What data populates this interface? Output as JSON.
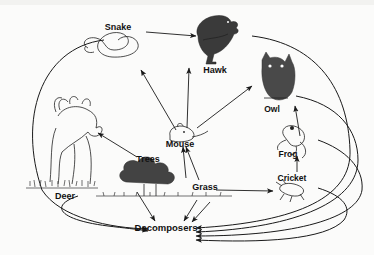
{
  "diagram": {
    "background_color": "#fbfbfa",
    "line_color": "#1a1a1a",
    "nodes": [
      {
        "id": "snake",
        "label": "Snake",
        "x": 118,
        "y": 30,
        "type": "consumer"
      },
      {
        "id": "hawk",
        "label": "Hawk",
        "x": 215,
        "y": 70,
        "type": "consumer"
      },
      {
        "id": "owl",
        "label": "Owl",
        "x": 272,
        "y": 110,
        "type": "consumer"
      },
      {
        "id": "mouse",
        "label": "Mouse",
        "x": 180,
        "y": 142,
        "type": "consumer"
      },
      {
        "id": "deer",
        "label": "Deer",
        "x": 65,
        "y": 185,
        "type": "consumer"
      },
      {
        "id": "trees",
        "label": "Trees",
        "x": 148,
        "y": 158,
        "type": "producer"
      },
      {
        "id": "grass",
        "label": "Grass",
        "x": 205,
        "y": 185,
        "type": "producer"
      },
      {
        "id": "frog",
        "label": "Frog",
        "x": 291,
        "y": 153,
        "type": "consumer"
      },
      {
        "id": "cricket",
        "label": "Cricket",
        "x": 292,
        "y": 178,
        "type": "consumer"
      },
      {
        "id": "decomposers",
        "label": "Decomposers",
        "x": 166,
        "y": 228,
        "type": "decomposer"
      }
    ],
    "edges": [
      {
        "from": "snake",
        "to": "hawk"
      },
      {
        "from": "mouse",
        "to": "snake"
      },
      {
        "from": "mouse",
        "to": "hawk"
      },
      {
        "from": "mouse",
        "to": "owl"
      },
      {
        "from": "grass",
        "to": "mouse"
      },
      {
        "from": "grass",
        "to": "cricket"
      },
      {
        "from": "cricket",
        "to": "frog"
      },
      {
        "from": "frog",
        "to": "owl"
      },
      {
        "from": "trees",
        "to": "deer"
      },
      {
        "from": "trees",
        "to": "decomposers"
      },
      {
        "from": "grass",
        "to": "decomposers"
      },
      {
        "from": "deer",
        "to": "decomposers"
      },
      {
        "from": "snake",
        "to": "decomposers"
      },
      {
        "from": "hawk",
        "to": "decomposers"
      },
      {
        "from": "owl",
        "to": "decomposers"
      },
      {
        "from": "frog",
        "to": "decomposers"
      },
      {
        "from": "cricket",
        "to": "decomposers"
      }
    ]
  }
}
